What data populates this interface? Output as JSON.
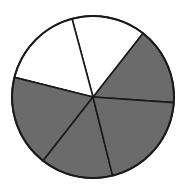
{
  "chart_data": {
    "type": "pie",
    "title": "",
    "subtitle": "",
    "xlabel": "",
    "ylabel": "",
    "legend": "none",
    "grid": false,
    "center": {
      "x": 93,
      "y": 97
    },
    "radius": 81,
    "total_slices": 6,
    "shaded_count": 4,
    "unshaded_count": 2,
    "shaded_fraction": "4/6",
    "unshaded_fraction": "2/6",
    "colors": {
      "shaded": "#6b6b6b",
      "unshaded": "#ffffff",
      "outline": "#1a1a1a",
      "background": "#ffffff"
    },
    "boundary_angles_deg": [
      356,
      52,
      105,
      166,
      232,
      284
    ],
    "categories": [
      "slice-1-right-upper",
      "slice-2-top-right",
      "slice-3-top-left",
      "slice-4-left",
      "slice-5-bottom-left",
      "slice-6-bottom-right"
    ],
    "values": [
      56,
      53,
      61,
      66,
      52,
      72
    ],
    "slices": [
      {
        "name": "slice-1-right-upper",
        "start_deg": 356,
        "end_deg": 412,
        "sweep_deg": 56,
        "fill": "shaded",
        "color": "#6b6b6b"
      },
      {
        "name": "slice-2-top-right",
        "start_deg": 52,
        "end_deg": 105,
        "sweep_deg": 53,
        "fill": "unshaded",
        "color": "#ffffff"
      },
      {
        "name": "slice-3-top-left",
        "start_deg": 105,
        "end_deg": 166,
        "sweep_deg": 61,
        "fill": "unshaded",
        "color": "#ffffff"
      },
      {
        "name": "slice-4-left",
        "start_deg": 166,
        "end_deg": 232,
        "sweep_deg": 66,
        "fill": "shaded",
        "color": "#6b6b6b"
      },
      {
        "name": "slice-5-bottom-left",
        "start_deg": 232,
        "end_deg": 284,
        "sweep_deg": 52,
        "fill": "shaded",
        "color": "#6b6b6b"
      },
      {
        "name": "slice-6-bottom-right",
        "start_deg": 284,
        "end_deg": 356,
        "sweep_deg": 72,
        "fill": "shaded",
        "color": "#6b6b6b"
      }
    ]
  }
}
